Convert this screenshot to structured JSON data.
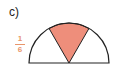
{
  "problem": {
    "label": "c)",
    "fraction": {
      "numerator": "1",
      "denominator": "6"
    }
  },
  "diagram": {
    "shape": "semicircle",
    "shaded_fraction_of_circle": "1/6",
    "shaded_angle_degrees": 60,
    "shaded_sector_start_deg": 60,
    "shaded_sector_end_deg": 120,
    "colors": {
      "outline": "#222222",
      "shaded_fill": "#EE8E7B",
      "fraction_text": "#E8956B"
    }
  }
}
